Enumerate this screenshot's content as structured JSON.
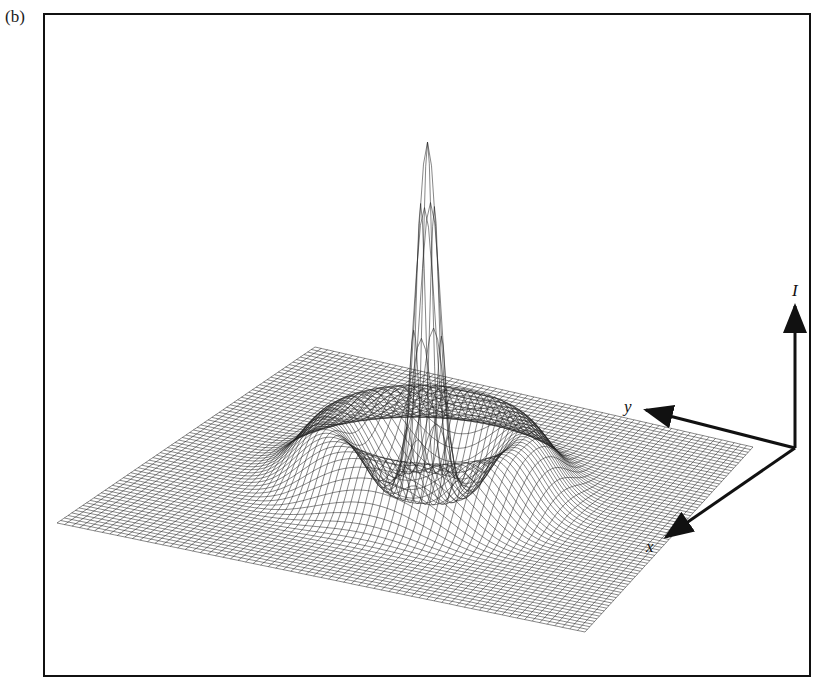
{
  "figure": {
    "panel_label": "(b)",
    "axes": {
      "vertical": "I",
      "depth": "y",
      "horizontal": "x"
    },
    "colors": {
      "ink": "#111111",
      "background": "#ffffff"
    }
  },
  "chart_data": {
    "type": "surface",
    "title": "",
    "axes_labels": {
      "z": "I",
      "y": "y",
      "x": "x"
    },
    "features": {
      "central_peak": {
        "relative_height": 1.0
      },
      "ring": {
        "relative_height": 0.2
      },
      "grid_lines_per_side": 70
    }
  }
}
